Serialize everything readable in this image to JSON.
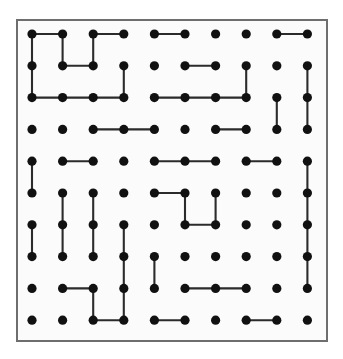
{
  "figure": {
    "kind": "dot-grid-puzzle",
    "title": "",
    "background_color": "#ffffff",
    "panel": {
      "x": 16,
      "y": 19,
      "width": 312,
      "height": 323,
      "fill_color": "#fbfbfb",
      "border_color": "#6e6e6e",
      "border_width": 2
    },
    "grid": {
      "rows": 10,
      "cols": 10,
      "origin_x": 32,
      "origin_y": 34,
      "spacing_x": 30.6,
      "spacing_y": 31.8,
      "dot_radius": 4.6,
      "dot_color": "#111111"
    },
    "edge_style": {
      "color": "#2b2b2b",
      "width": 2.1
    }
  },
  "chart_data": {
    "type": "scatter",
    "title": "",
    "xlabel": "",
    "ylabel": "",
    "rows": 10,
    "cols": 10,
    "dot_count": 100,
    "row_labels": [
      "1",
      "2",
      "3",
      "4",
      "5",
      "6",
      "7",
      "8",
      "9",
      "10"
    ],
    "col_labels": [
      "1",
      "2",
      "3",
      "4",
      "5",
      "6",
      "7",
      "8",
      "9",
      "10"
    ],
    "horizontal_edges": [
      {
        "row": 1,
        "col_from": 1,
        "col_to": 2
      },
      {
        "row": 1,
        "col_from": 3,
        "col_to": 4
      },
      {
        "row": 1,
        "col_from": 5,
        "col_to": 6
      },
      {
        "row": 1,
        "col_from": 9,
        "col_to": 10
      },
      {
        "row": 2,
        "col_from": 2,
        "col_to": 3
      },
      {
        "row": 2,
        "col_from": 6,
        "col_to": 7
      },
      {
        "row": 3,
        "col_from": 1,
        "col_to": 2
      },
      {
        "row": 3,
        "col_from": 2,
        "col_to": 3
      },
      {
        "row": 3,
        "col_from": 3,
        "col_to": 4
      },
      {
        "row": 3,
        "col_from": 5,
        "col_to": 6
      },
      {
        "row": 3,
        "col_from": 6,
        "col_to": 7
      },
      {
        "row": 3,
        "col_from": 7,
        "col_to": 8
      },
      {
        "row": 4,
        "col_from": 3,
        "col_to": 4
      },
      {
        "row": 4,
        "col_from": 4,
        "col_to": 5
      },
      {
        "row": 4,
        "col_from": 7,
        "col_to": 8
      },
      {
        "row": 5,
        "col_from": 2,
        "col_to": 3
      },
      {
        "row": 5,
        "col_from": 5,
        "col_to": 6
      },
      {
        "row": 5,
        "col_from": 6,
        "col_to": 7
      },
      {
        "row": 5,
        "col_from": 8,
        "col_to": 9
      },
      {
        "row": 6,
        "col_from": 5,
        "col_to": 6
      },
      {
        "row": 7,
        "col_from": 6,
        "col_to": 7
      },
      {
        "row": 9,
        "col_from": 2,
        "col_to": 3
      },
      {
        "row": 9,
        "col_from": 6,
        "col_to": 7
      },
      {
        "row": 9,
        "col_from": 7,
        "col_to": 8
      },
      {
        "row": 10,
        "col_from": 3,
        "col_to": 4
      },
      {
        "row": 10,
        "col_from": 5,
        "col_to": 6
      },
      {
        "row": 10,
        "col_from": 8,
        "col_to": 9
      }
    ],
    "vertical_edges": [
      {
        "col": 1,
        "row_from": 1,
        "row_to": 2
      },
      {
        "col": 1,
        "row_from": 2,
        "row_to": 3
      },
      {
        "col": 1,
        "row_from": 5,
        "row_to": 6
      },
      {
        "col": 1,
        "row_from": 7,
        "row_to": 8
      },
      {
        "col": 2,
        "row_from": 1,
        "row_to": 2
      },
      {
        "col": 2,
        "row_from": 6,
        "row_to": 7
      },
      {
        "col": 2,
        "row_from": 7,
        "row_to": 8
      },
      {
        "col": 3,
        "row_from": 1,
        "row_to": 2
      },
      {
        "col": 3,
        "row_from": 6,
        "row_to": 7
      },
      {
        "col": 3,
        "row_from": 7,
        "row_to": 8
      },
      {
        "col": 3,
        "row_from": 9,
        "row_to": 10
      },
      {
        "col": 4,
        "row_from": 2,
        "row_to": 3
      },
      {
        "col": 4,
        "row_from": 7,
        "row_to": 8
      },
      {
        "col": 4,
        "row_from": 8,
        "row_to": 9
      },
      {
        "col": 4,
        "row_from": 9,
        "row_to": 10
      },
      {
        "col": 5,
        "row_from": 8,
        "row_to": 9
      },
      {
        "col": 6,
        "row_from": 6,
        "row_to": 7
      },
      {
        "col": 7,
        "row_from": 6,
        "row_to": 7
      },
      {
        "col": 8,
        "row_from": 2,
        "row_to": 3
      },
      {
        "col": 9,
        "row_from": 3,
        "row_to": 4
      },
      {
        "col": 10,
        "row_from": 2,
        "row_to": 3
      },
      {
        "col": 10,
        "row_from": 3,
        "row_to": 4
      },
      {
        "col": 10,
        "row_from": 5,
        "row_to": 6
      },
      {
        "col": 10,
        "row_from": 6,
        "row_to": 7
      },
      {
        "col": 10,
        "row_from": 7,
        "row_to": 8
      },
      {
        "col": 10,
        "row_from": 8,
        "row_to": 9
      }
    ]
  }
}
